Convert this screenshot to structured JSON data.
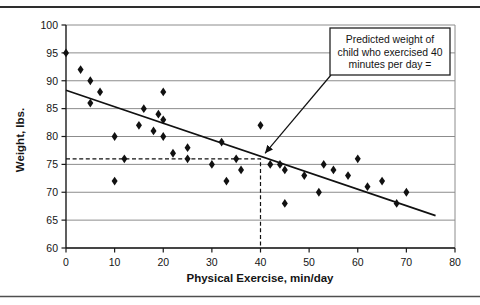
{
  "chart_data": {
    "type": "scatter",
    "title": "",
    "xlabel": "Physical Exercise, min/day",
    "ylabel": "Weight, lbs.",
    "xlim": [
      0,
      80
    ],
    "ylim": [
      60,
      100
    ],
    "x_ticks": [
      0,
      10,
      20,
      30,
      40,
      50,
      60,
      70,
      80
    ],
    "y_ticks": [
      60,
      65,
      70,
      75,
      80,
      85,
      90,
      95,
      100
    ],
    "grid": "horizontal-only",
    "legend": "none",
    "marker": "filled-diamond",
    "points": [
      [
        0,
        95
      ],
      [
        3,
        92
      ],
      [
        5,
        90
      ],
      [
        7,
        88
      ],
      [
        5,
        86
      ],
      [
        10,
        80
      ],
      [
        10,
        72
      ],
      [
        12,
        76
      ],
      [
        15,
        82
      ],
      [
        16,
        85
      ],
      [
        18,
        81
      ],
      [
        19,
        84
      ],
      [
        20,
        88
      ],
      [
        20,
        83
      ],
      [
        20,
        80
      ],
      [
        22,
        77
      ],
      [
        25,
        78
      ],
      [
        25,
        76
      ],
      [
        30,
        75
      ],
      [
        32,
        79
      ],
      [
        33,
        72
      ],
      [
        35,
        76
      ],
      [
        36,
        74
      ],
      [
        40,
        82
      ],
      [
        42,
        75
      ],
      [
        44,
        75
      ],
      [
        45,
        74
      ],
      [
        45,
        68
      ],
      [
        49,
        73
      ],
      [
        52,
        70
      ],
      [
        53,
        75
      ],
      [
        55,
        74
      ],
      [
        58,
        73
      ],
      [
        60,
        76
      ],
      [
        62,
        71
      ],
      [
        65,
        72
      ],
      [
        68,
        68
      ],
      [
        70,
        70
      ]
    ],
    "trend_line": {
      "x1": 0,
      "y1": 88.3,
      "x2": 76,
      "y2": 65.8
    },
    "prediction_guides": {
      "x": 40,
      "y": 76
    },
    "annotation": {
      "line1": "Predicted weight of",
      "line2": "child who exercised 40",
      "line3": "minutes per day =",
      "points_to": {
        "x": 40,
        "y": 76
      }
    },
    "colors": {
      "marker": "#111111",
      "trend_line": "#111111",
      "gridline": "#8c8c8c",
      "axis": "#1a1a1a",
      "dashed_guide": "#111111",
      "annotation_border": "#222222",
      "background": "#ffffff"
    }
  }
}
